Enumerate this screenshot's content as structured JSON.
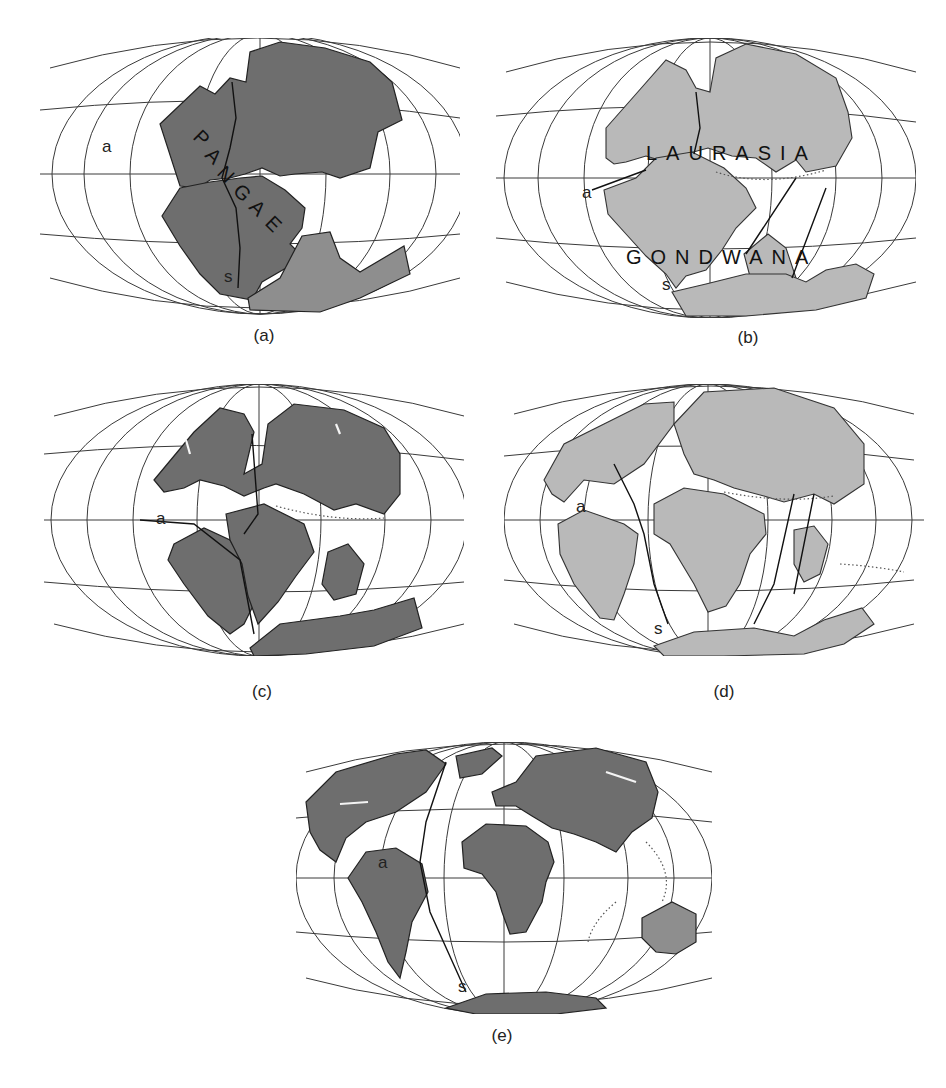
{
  "figure": {
    "colors": {
      "background": "#ffffff",
      "grid_lines": "#3a3a3a",
      "land_dark": "#6e6e6e",
      "land_mid": "#8e8e8e",
      "land_light": "#b9b9b9"
    },
    "panels": [
      {
        "id": "a",
        "caption": "(a)",
        "map_labels": [
          "P",
          "A",
          "N",
          "G",
          "A",
          "E"
        ],
        "map_label_text": "PANGAEA",
        "point_labels": {
          "a": "a",
          "s": "s"
        }
      },
      {
        "id": "b",
        "caption": "(b)",
        "map_label_north": "LAURASIA",
        "map_label_south": "GONDWANA",
        "point_labels": {
          "a": "a",
          "s": "s"
        }
      },
      {
        "id": "c",
        "caption": "(c)",
        "point_labels": {
          "a": "a"
        }
      },
      {
        "id": "d",
        "caption": "(d)",
        "point_labels": {
          "a": "a",
          "s": "s"
        }
      },
      {
        "id": "e",
        "caption": "(e)",
        "point_labels": {
          "a": "a",
          "s": "s"
        }
      }
    ]
  }
}
